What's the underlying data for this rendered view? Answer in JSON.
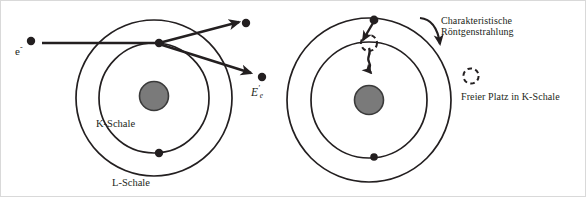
{
  "figure": {
    "background_color": "#ffffff",
    "ink_color": "#231f20",
    "nucleus_fill": "#7a7a7a",
    "width": 586,
    "height": 197
  },
  "left_diagram": {
    "name": "ionization-stage",
    "incident_electron_label": "e",
    "incident_electron_charge": "-",
    "scattered_energy_label": "E",
    "scattered_energy_subscript": "e",
    "scattered_energy_prime": "'",
    "inner_shell_label": "K-Schale",
    "outer_shell_label": "L-Schale",
    "nucleus_label": "nucleus",
    "electrons": [
      {
        "name": "collision-electron",
        "cx": 158,
        "cy": 42
      },
      {
        "name": "outer-shell-electron",
        "cx": 158,
        "cy": 152
      }
    ],
    "ejected_electron_dot": {
      "cx": 245,
      "cy": 22
    },
    "scattered_electron_dot": {
      "cx": 261,
      "cy": 76
    },
    "incident_dot": {
      "cx": 30,
      "cy": 40
    }
  },
  "right_diagram": {
    "name": "relaxation-stage",
    "vacancy_name": "freier-platz-k-schale",
    "electrons": [
      {
        "name": "falling-electron",
        "cx": 373,
        "cy": 19
      },
      {
        "name": "outer-shell-electron",
        "cx": 373,
        "cy": 156
      }
    ],
    "vacancy": {
      "cx": 368,
      "cy": 42,
      "r": 8
    }
  },
  "annotations": {
    "xray_label_line1": "Charakteristische",
    "xray_label_line2": "Röntgenstrahlung",
    "legend_label": "Freier Platz  in K-Schale",
    "legend_symbol": "dashed-circle"
  }
}
